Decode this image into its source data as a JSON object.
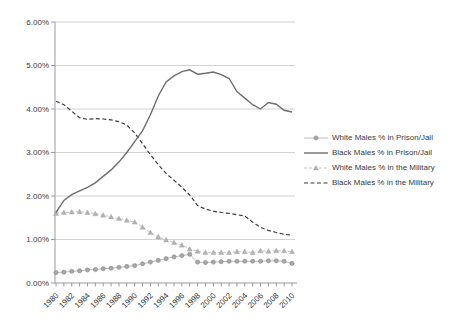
{
  "chart_data": {
    "type": "line",
    "title": "",
    "xlabel": "",
    "ylabel": "",
    "ylim": [
      0,
      6
    ],
    "grid": "horizontal",
    "legend_position": "right",
    "y_tick_labels": [
      "0.00%",
      "1.00%",
      "2.00%",
      "3.00%",
      "4.00%",
      "5.00%",
      "6.00%"
    ],
    "x_tick_labels": [
      "1980",
      "1982",
      "1984",
      "1986",
      "1988",
      "1990",
      "1992",
      "1994",
      "1996",
      "1998",
      "2000",
      "2002",
      "2004",
      "2006",
      "2008",
      "2010"
    ],
    "x": [
      1980,
      1981,
      1982,
      1983,
      1984,
      1985,
      1986,
      1987,
      1988,
      1989,
      1990,
      1991,
      1992,
      1993,
      1994,
      1995,
      1996,
      1997,
      1998,
      1999,
      2000,
      2001,
      2002,
      2003,
      2004,
      2005,
      2006,
      2007,
      2008,
      2009,
      2010
    ],
    "colors": {
      "gridline": "#c6c6c6",
      "axis": "#9b9b9b",
      "tick_text": "#3a3a3a",
      "legend_text": "#3a3a3a",
      "background": "#ffffff"
    },
    "series": [
      {
        "name": "White Males % in Prison/Jail",
        "line": "solid",
        "marker": "circle",
        "color": "#b3b3b3",
        "marker_color": "#a6a6a6",
        "marker_edge": "#8c8c8c",
        "width": 0.9,
        "values": [
          0.24,
          0.25,
          0.27,
          0.28,
          0.3,
          0.31,
          0.33,
          0.34,
          0.36,
          0.38,
          0.4,
          0.44,
          0.48,
          0.52,
          0.56,
          0.6,
          0.63,
          0.66,
          0.48,
          0.47,
          0.48,
          0.49,
          0.5,
          0.5,
          0.5,
          0.5,
          0.5,
          0.51,
          0.51,
          0.5,
          0.45
        ]
      },
      {
        "name": "Black Males % in Prison/Jail",
        "line": "solid",
        "marker": "none",
        "color": "#6e6e6e",
        "width": 1.4,
        "values": [
          1.62,
          1.9,
          2.03,
          2.12,
          2.2,
          2.3,
          2.45,
          2.6,
          2.78,
          3.0,
          3.25,
          3.5,
          3.87,
          4.3,
          4.62,
          4.76,
          4.86,
          4.9,
          4.8,
          4.82,
          4.85,
          4.79,
          4.7,
          4.4,
          4.25,
          4.1,
          4.0,
          4.15,
          4.11,
          3.97,
          3.93
        ]
      },
      {
        "name": "White Males % in the Military",
        "line": "dashed",
        "marker": "triangle",
        "color": "#bdbdbd",
        "marker_color": "#b3b3b3",
        "marker_edge": "#9e9e9e",
        "width": 0.9,
        "values": [
          1.6,
          1.62,
          1.63,
          1.64,
          1.62,
          1.59,
          1.56,
          1.52,
          1.48,
          1.44,
          1.4,
          1.28,
          1.16,
          1.06,
          0.99,
          0.93,
          0.87,
          0.78,
          0.73,
          0.7,
          0.7,
          0.7,
          0.7,
          0.72,
          0.72,
          0.7,
          0.74,
          0.73,
          0.74,
          0.74,
          0.72
        ]
      },
      {
        "name": "Black Males % in the Military",
        "line": "dashed",
        "marker": "none",
        "color": "#3d3d3d",
        "width": 1.2,
        "values": [
          4.18,
          4.1,
          3.95,
          3.8,
          3.76,
          3.78,
          3.77,
          3.75,
          3.71,
          3.63,
          3.45,
          3.2,
          2.95,
          2.72,
          2.52,
          2.36,
          2.2,
          2.02,
          1.78,
          1.7,
          1.65,
          1.62,
          1.6,
          1.57,
          1.54,
          1.4,
          1.28,
          1.21,
          1.16,
          1.12,
          1.1
        ]
      }
    ]
  }
}
